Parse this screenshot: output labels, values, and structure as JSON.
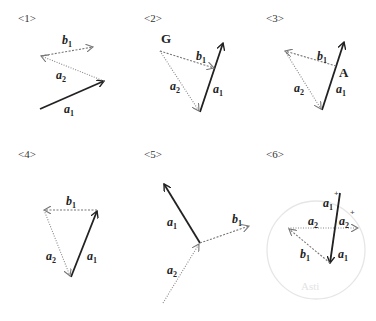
{
  "panels": [
    {
      "id": "<1>",
      "labels": {
        "b1": "b",
        "a2": "a",
        "a1": "a"
      },
      "subs": {
        "b1": "1",
        "a2": "2",
        "a1": "1"
      }
    },
    {
      "id": "<2>",
      "point": "G",
      "labels": {
        "b1": "b",
        "a2": "a",
        "a1": "a"
      },
      "subs": {
        "b1": "1",
        "a2": "2",
        "a1": "1"
      }
    },
    {
      "id": "<3>",
      "point": "A",
      "labels": {
        "b1": "b",
        "a2": "a",
        "a1": "a"
      },
      "subs": {
        "b1": "1",
        "a2": "2",
        "a1": "1"
      }
    },
    {
      "id": "<4>",
      "labels": {
        "b1": "b",
        "a2": "a",
        "a1": "a"
      },
      "subs": {
        "b1": "1",
        "a2": "2",
        "a1": "1"
      }
    },
    {
      "id": "<5>",
      "labels": {
        "b1": "b",
        "a2": "a",
        "a1": "a"
      },
      "subs": {
        "b1": "1",
        "a2": "2",
        "a1": "1"
      }
    },
    {
      "id": "<6>",
      "labels": {
        "a1_top": "a",
        "a2_left": "a",
        "a2_right": "a",
        "b1": "b",
        "a1_bottom": "a"
      },
      "subs": {
        "a1_top": "1",
        "a2_left": "2",
        "a2_right": "2",
        "b1": "1",
        "a1_bottom": "1"
      },
      "plus_marks": [
        "+",
        "+"
      ],
      "faint_text": "Asti"
    }
  ]
}
